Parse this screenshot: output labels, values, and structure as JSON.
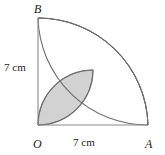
{
  "figure": {
    "vertices": [
      {
        "name": "B",
        "label": "B",
        "x": 38,
        "y": 18
      },
      {
        "name": "O",
        "label": "O",
        "x": 38,
        "y": 125
      },
      {
        "name": "A",
        "label": "A",
        "x": 148,
        "y": 125
      }
    ],
    "dimensions": [
      {
        "name": "vertical-side",
        "label": "7 cm",
        "value": 7,
        "unit": "cm",
        "side": "OB"
      },
      {
        "name": "horizontal-side",
        "label": "7 cm",
        "value": 7,
        "unit": "cm",
        "side": "OA"
      }
    ],
    "colors": {
      "shade": "#d2d2d2",
      "stroke": "#6e6e6e",
      "line": "#8a8a8a",
      "text": "#1a1a1a",
      "background": "#ffffff"
    },
    "geometry": {
      "square_side_px": 110,
      "origin_px": {
        "x": 38,
        "y": 125
      },
      "quarter_circle_center": "O",
      "quarter_circle_radius": 7,
      "arc_from_A_center": "A",
      "semicircle_radius": 3.5,
      "intersection_point_px": {
        "x": 93,
        "y": 70
      }
    }
  }
}
